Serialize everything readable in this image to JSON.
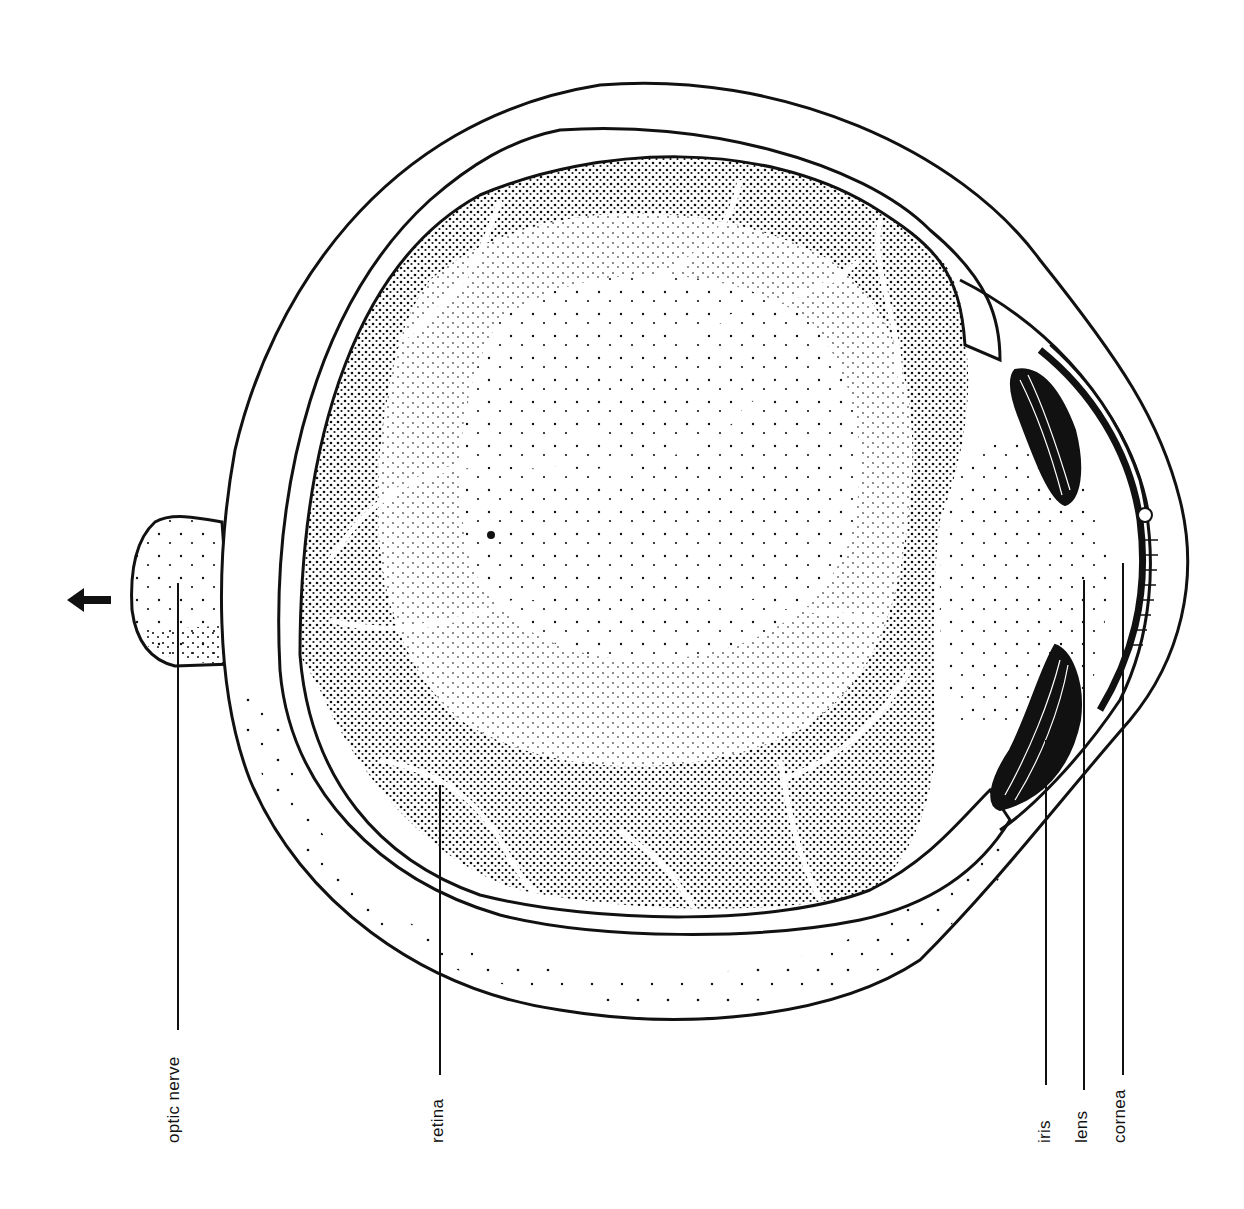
{
  "diagram": {
    "orientation": "rotated 90° counter-clockwise; labels read bottom-to-top",
    "direction_arrow": "arrow-left",
    "labels": [
      {
        "id": "optic-nerve",
        "text": "optic nerve"
      },
      {
        "id": "retina",
        "text": "retina"
      },
      {
        "id": "iris",
        "text": "iris"
      },
      {
        "id": "lens",
        "text": "lens"
      },
      {
        "id": "cornea",
        "text": "cornea"
      }
    ],
    "colors": {
      "ink": "#111111",
      "background": "#ffffff"
    }
  }
}
